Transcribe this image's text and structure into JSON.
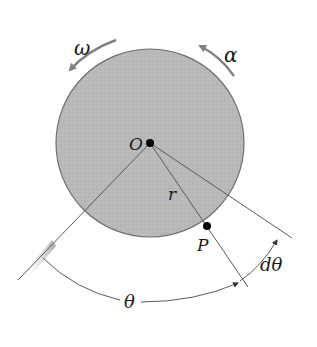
{
  "figure": {
    "colors": {
      "disk_fill": "#b9b9b9",
      "disk_edge": "#6e6e6e",
      "line": "#5a5a5a",
      "arrow": "#808080",
      "point": "#000000",
      "hatch": "#9a9a9a"
    }
  },
  "labels": {
    "omega": "ω",
    "alpha": "α",
    "origin": "O",
    "radius": "r",
    "point": "P",
    "theta": "θ",
    "dtheta": "dθ"
  }
}
